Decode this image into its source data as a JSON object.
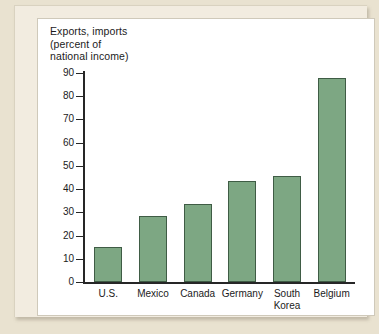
{
  "chart_data": {
    "type": "bar",
    "title": "Exports, imports\n(percent of\nnational income)",
    "title_lines": [
      "Exports, imports",
      "(percent of",
      "national income)"
    ],
    "xlabel": "",
    "ylabel": "Exports, imports (percent of national income)",
    "categories": [
      "U.S.",
      "Mexico",
      "Canada",
      "Germany",
      "South\nKorea",
      "Belgium"
    ],
    "values": [
      15,
      28.5,
      33.5,
      43.5,
      45.5,
      88
    ],
    "ylim": [
      0,
      90
    ],
    "ytick_labels": [
      "0",
      "10",
      "20",
      "30",
      "40",
      "50",
      "60",
      "70",
      "80",
      "90"
    ],
    "ytick_values": [
      0,
      10,
      20,
      30,
      40,
      50,
      60,
      70,
      80,
      90
    ],
    "grid": false,
    "legend": null,
    "bar_color": "#7da783",
    "bar_edge_color": "#3f5c45",
    "axis_color": "#262626",
    "plot_background": "#ffffff",
    "figure_background": "#e9e2d0",
    "mat_background": "#f2ece0"
  }
}
